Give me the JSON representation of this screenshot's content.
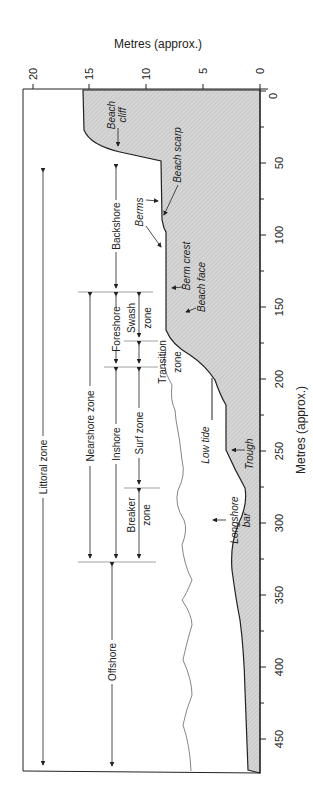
{
  "title_top": "Metres (approx.)",
  "title_right": "Metres (approx.)",
  "height_axis": {
    "label": "Metres (approx.)",
    "ticks": [
      "20",
      "15",
      "10",
      "5",
      "0"
    ],
    "zero_side_label": "0"
  },
  "distance_axis": {
    "label": "Metres (approx.)",
    "ticks": [
      "50",
      "100",
      "150",
      "200",
      "250",
      "300",
      "350",
      "400",
      "450"
    ]
  },
  "zones": {
    "littoral": "Littoral zone",
    "nearshore": "Nearshore zone",
    "offshore": "Offshore",
    "backshore": "Backshore",
    "foreshore": "Foreshore",
    "inshore": "Inshore",
    "swash_1": "Swash",
    "swash_2": "zone",
    "transition_1": "Transition",
    "transition_2": "zone",
    "surf": "Surf zone",
    "breaker_1": "Breaker",
    "breaker_2": "zone"
  },
  "features": {
    "beach_cliff_1": "Beach",
    "beach_cliff_2": "cliff",
    "beach_scarp": "Beach scarp",
    "berms": "Berms",
    "berm_crest": "Berm crest",
    "beach_face": "Beach face",
    "low_tide": "Low tide",
    "trough": "Trough",
    "longshore_bar_1": "Longshore",
    "longshore_bar_2": "bar"
  },
  "colors": {
    "land_fill": "#cfcfcf",
    "line": "#222222",
    "water_line": "#666666"
  }
}
